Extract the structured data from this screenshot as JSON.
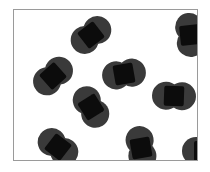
{
  "figure": {
    "type": "particle-diagram",
    "background_color": "#ffffff",
    "frame": {
      "border_color": "#9a9a9a",
      "border_width_px": 1,
      "fill_color": "#ffffff",
      "x": 13,
      "y": 9,
      "width": 185,
      "height": 152
    },
    "particle_style": {
      "atom_color": "#3a3a3a",
      "overlap_color": "#0c0c0c",
      "atom_radius_px": 14,
      "bond_length_px": 16,
      "shape": "two-overlapping-circles"
    },
    "molecule_count": 9,
    "molecules": [
      {
        "id": "molecule-1",
        "label": "top-left-diagonal",
        "cx": 39,
        "cy": 66,
        "angle_deg": -42
      },
      {
        "id": "molecule-2",
        "label": "top-center-diagonal",
        "cx": 77,
        "cy": 25,
        "angle_deg": -38
      },
      {
        "id": "molecule-3",
        "label": "top-right-vertical",
        "cx": 176,
        "cy": 25,
        "angle_deg": 84
      },
      {
        "id": "molecule-4",
        "label": "center-horizontal",
        "cx": 110,
        "cy": 64,
        "angle_deg": -10
      },
      {
        "id": "molecule-5",
        "label": "mid-right-horizontal",
        "cx": 160,
        "cy": 86,
        "angle_deg": 2
      },
      {
        "id": "molecule-6",
        "label": "mid-left-diagonal",
        "cx": 77,
        "cy": 97,
        "angle_deg": 58
      },
      {
        "id": "molecule-7",
        "label": "bottom-left-diagonal",
        "cx": 44,
        "cy": 137,
        "angle_deg": 38
      },
      {
        "id": "molecule-8",
        "label": "bottom-center-vertical",
        "cx": 127,
        "cy": 138,
        "angle_deg": 80
      },
      {
        "id": "molecule-9",
        "label": "bottom-right-horizontal",
        "cx": 190,
        "cy": 141,
        "angle_deg": 0
      }
    ]
  }
}
